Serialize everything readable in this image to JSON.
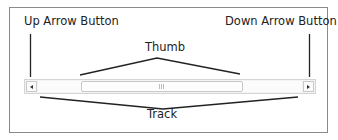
{
  "diagram": {
    "labels": {
      "up_arrow_button": "Up Arrow Button",
      "down_arrow_button": "Down Arrow Button",
      "thumb": "Thumb",
      "track": "Track"
    },
    "scrollbar": {
      "orientation": "horizontal",
      "up_icon": "triangle-left-icon",
      "down_icon": "triangle-right-icon",
      "thumb_grip_icon": "grip-lines-icon"
    },
    "colors": {
      "leader_line": "#222222",
      "frame_border": "#8a8a8a",
      "scrollbar_border": "#d4d4d4"
    }
  }
}
